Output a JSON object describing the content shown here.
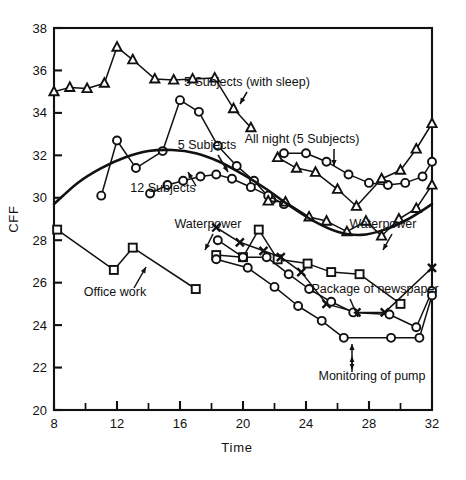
{
  "chart_data": {
    "type": "line",
    "title": "",
    "xlabel": "Time",
    "ylabel": "CFF",
    "xlim": [
      8,
      32
    ],
    "ylim": [
      20,
      38
    ],
    "x_major_ticks": [
      8,
      12,
      16,
      20,
      24,
      28,
      32
    ],
    "x_minor_ticks": [
      10,
      14,
      18,
      22,
      26,
      30
    ],
    "y_major_ticks": [
      20,
      22,
      24,
      26,
      28,
      30,
      32,
      34,
      36,
      38
    ],
    "x_tick_labels": [
      "8",
      "12",
      "16",
      "20",
      "24",
      "28",
      "32"
    ],
    "y_tick_labels": [
      "20",
      "22",
      "24",
      "26",
      "28",
      "30",
      "32",
      "34",
      "36",
      "38"
    ],
    "grid": false,
    "legend_position": "inline-annotations",
    "series": [
      {
        "name": "5 Subjects (with sleep)",
        "marker": "triangle",
        "points": [
          [
            8.0,
            35.0
          ],
          [
            9.0,
            35.2
          ],
          [
            10.1,
            35.15
          ],
          [
            11.2,
            35.4
          ],
          [
            12.0,
            37.1
          ],
          [
            13.0,
            36.5
          ],
          [
            14.4,
            35.6
          ],
          [
            15.6,
            35.55
          ],
          [
            16.8,
            35.6
          ],
          [
            18.2,
            35.65
          ],
          [
            19.4,
            34.2
          ],
          [
            20.5,
            33.3
          ]
        ]
      },
      {
        "name": "5 Subjects",
        "marker": "circle",
        "points": [
          [
            11.0,
            30.1
          ],
          [
            12.0,
            32.7
          ],
          [
            13.2,
            31.4
          ],
          [
            14.9,
            32.2
          ],
          [
            16.0,
            34.6
          ],
          [
            17.2,
            34.05
          ],
          [
            18.4,
            32.45
          ],
          [
            19.6,
            31.5
          ],
          [
            20.7,
            30.8
          ],
          [
            21.8,
            29.9
          ]
        ]
      },
      {
        "name": "12 Subjects",
        "marker": "circle",
        "points": [
          [
            14.1,
            30.2
          ],
          [
            15.2,
            30.6
          ],
          [
            16.2,
            30.8
          ],
          [
            17.3,
            31.0
          ],
          [
            18.3,
            31.1
          ],
          [
            19.3,
            30.9
          ],
          [
            20.5,
            30.5
          ],
          [
            21.6,
            30.1
          ],
          [
            22.6,
            29.7
          ]
        ]
      },
      {
        "name": "Waterpower",
        "marker": "triangle",
        "points": [
          [
            21.6,
            29.85
          ],
          [
            22.7,
            29.8
          ],
          [
            24.2,
            29.1
          ],
          [
            25.3,
            28.9
          ],
          [
            26.6,
            28.4
          ],
          [
            27.8,
            28.9
          ],
          [
            28.8,
            28.2
          ],
          [
            29.9,
            29.0
          ],
          [
            31.0,
            29.5
          ],
          [
            32.0,
            30.6
          ]
        ]
      },
      {
        "name": "All night (5 Subjects) circles",
        "marker": "circle",
        "points": [
          [
            22.6,
            32.1
          ],
          [
            24.0,
            32.1
          ],
          [
            25.3,
            31.7
          ],
          [
            26.7,
            31.1
          ],
          [
            28.0,
            30.7
          ],
          [
            29.2,
            30.6
          ],
          [
            30.3,
            30.7
          ],
          [
            31.4,
            31.0
          ],
          [
            32.0,
            31.7
          ]
        ]
      },
      {
        "name": "All night (5 Subjects) triangles",
        "marker": "triangle",
        "points": [
          [
            22.2,
            31.9
          ],
          [
            23.4,
            31.4
          ],
          [
            24.6,
            31.2
          ],
          [
            26.0,
            30.4
          ],
          [
            27.2,
            29.6
          ],
          [
            28.8,
            30.9
          ],
          [
            30.0,
            31.3
          ],
          [
            31.0,
            32.3
          ],
          [
            32.0,
            33.5
          ]
        ]
      },
      {
        "name": "Office work",
        "marker": "square",
        "points": [
          [
            8.2,
            28.5
          ],
          [
            11.8,
            26.6
          ],
          [
            13.0,
            27.65
          ],
          [
            17.0,
            25.7
          ]
        ]
      },
      {
        "name": "Package of newspaper",
        "marker": "square",
        "points": [
          [
            18.3,
            27.3
          ],
          [
            20.0,
            27.2
          ],
          [
            21.0,
            28.5
          ],
          [
            22.2,
            27.1
          ],
          [
            24.1,
            26.9
          ],
          [
            25.6,
            26.5
          ],
          [
            27.4,
            26.4
          ],
          [
            30.0,
            25.0
          ]
        ]
      },
      {
        "name": "Monitoring of pump crosses",
        "marker": "cross",
        "points": [
          [
            18.3,
            28.6
          ],
          [
            19.8,
            27.9
          ],
          [
            21.3,
            27.5
          ],
          [
            22.4,
            27.2
          ],
          [
            23.7,
            26.5
          ],
          [
            25.3,
            25.0
          ],
          [
            27.2,
            24.6
          ],
          [
            29.0,
            24.6
          ],
          [
            32.0,
            26.7
          ]
        ]
      },
      {
        "name": "Monitoring of pump circles upper",
        "marker": "circle",
        "points": [
          [
            18.4,
            28.0
          ],
          [
            20.0,
            27.2
          ],
          [
            21.5,
            27.2
          ],
          [
            22.9,
            26.4
          ],
          [
            24.2,
            25.7
          ],
          [
            25.6,
            25.1
          ],
          [
            27.0,
            24.6
          ],
          [
            29.3,
            24.5
          ],
          [
            31.0,
            23.9
          ],
          [
            32.0,
            25.6
          ]
        ]
      },
      {
        "name": "Monitoring of pump circles lower",
        "marker": "circle",
        "points": [
          [
            18.3,
            27.1
          ],
          [
            20.3,
            26.7
          ],
          [
            22.0,
            25.8
          ],
          [
            23.5,
            24.9
          ],
          [
            25.0,
            24.2
          ],
          [
            26.4,
            23.4
          ],
          [
            29.4,
            23.4
          ],
          [
            31.2,
            23.4
          ],
          [
            32.0,
            25.4
          ]
        ]
      },
      {
        "name": "Reference sinusoid",
        "marker": "none",
        "smooth": true,
        "points": [
          [
            8.0,
            29.7
          ],
          [
            9.5,
            30.7
          ],
          [
            11.0,
            31.4
          ],
          [
            12.5,
            31.9
          ],
          [
            14.0,
            32.2
          ],
          [
            15.5,
            32.25
          ],
          [
            17.0,
            32.1
          ],
          [
            18.5,
            31.7
          ],
          [
            20.0,
            31.1
          ],
          [
            21.5,
            30.4
          ],
          [
            23.0,
            29.6
          ],
          [
            24.5,
            28.9
          ],
          [
            26.0,
            28.4
          ],
          [
            27.5,
            28.25
          ],
          [
            29.0,
            28.5
          ],
          [
            30.5,
            29.0
          ],
          [
            32.0,
            29.7
          ]
        ]
      }
    ],
    "annotations": [
      {
        "id": "ann-5subj-sleep",
        "text": "5 Subjects (with sleep)",
        "x": 247,
        "y": 86
      },
      {
        "id": "ann-5subj",
        "text": "5 Subjects",
        "x": 207,
        "y": 149
      },
      {
        "id": "ann-all-night",
        "text": "All night (5 Subjects)",
        "x": 302,
        "y": 143
      },
      {
        "id": "ann-12subj",
        "text": "12 Subjects",
        "x": 163,
        "y": 192
      },
      {
        "id": "ann-waterpower-left",
        "text": "Waterpower",
        "x": 208,
        "y": 228
      },
      {
        "id": "ann-waterpower-right",
        "text": "Waterpower",
        "x": 383,
        "y": 228
      },
      {
        "id": "ann-office-work",
        "text": "Office work",
        "x": 115,
        "y": 296
      },
      {
        "id": "ann-package-newspaper",
        "text": "Package of newspaper",
        "x": 375,
        "y": 293
      },
      {
        "id": "ann-monitoring-pump",
        "text": "Monitoring of pump",
        "x": 372,
        "y": 380
      }
    ],
    "colors": {
      "ink": "#111111",
      "background": "#ffffff"
    }
  }
}
